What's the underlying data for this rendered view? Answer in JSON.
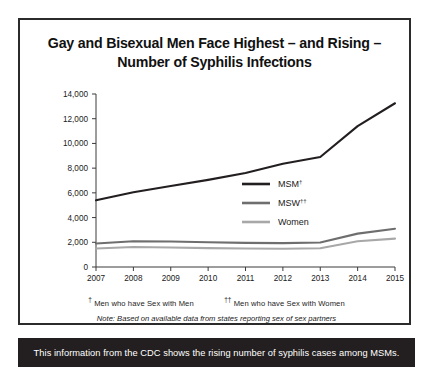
{
  "title": "Gay and Bisexual Men Face Highest – and Rising – Number of Syphilis Infections",
  "footnotes": {
    "msm": "Men who have Sex with Men",
    "msw": "Men who have Sex with Women",
    "msm_marker": "†",
    "msw_marker": "††",
    "note": "Note: Based on available data from states reporting sex of sex partners"
  },
  "banner": {
    "text": "This information from the CDC shows the rising number of syphilis cases among MSMs."
  },
  "colors": {
    "msm": "#231f20",
    "msw": "#6e6e6e",
    "women": "#a8a8a8",
    "axis": "#3a3a3a",
    "banner_bg": "#231f20",
    "border": "#2b2b2b"
  },
  "chart_data": {
    "type": "line",
    "title": "Gay and Bisexual Men Face Highest – and Rising – Number of Syphilis Infections",
    "xlabel": "",
    "ylabel": "",
    "x": [
      2007,
      2008,
      2009,
      2010,
      2011,
      2012,
      2013,
      2014,
      2015
    ],
    "categories": [
      "2007",
      "2008",
      "2009",
      "2010",
      "2011",
      "2012",
      "2013",
      "2014",
      "2015"
    ],
    "ytick_labels": [
      "0",
      "2,000",
      "4,000",
      "6,000",
      "8,000",
      "10,000",
      "12,000",
      "14,000"
    ],
    "ytick_values": [
      0,
      2000,
      4000,
      6000,
      8000,
      10000,
      12000,
      14000
    ],
    "ylim": [
      0,
      14000
    ],
    "xlim": [
      2007,
      2015
    ],
    "grid": false,
    "legend_position": "inside-right",
    "series": [
      {
        "name": "MSM†",
        "legend_label": "MSM",
        "marker": "†",
        "color": "#231f20",
        "values": [
          5400,
          6050,
          6550,
          7050,
          7600,
          8350,
          8900,
          11400,
          13250
        ]
      },
      {
        "name": "MSW††",
        "legend_label": "MSW",
        "marker": "††",
        "color": "#6e6e6e",
        "values": [
          1900,
          2080,
          2060,
          2000,
          1950,
          1930,
          1980,
          2700,
          3100
        ]
      },
      {
        "name": "Women",
        "legend_label": "Women",
        "marker": "",
        "color": "#a8a8a8",
        "values": [
          1500,
          1620,
          1580,
          1530,
          1500,
          1480,
          1520,
          2080,
          2300
        ]
      }
    ]
  }
}
